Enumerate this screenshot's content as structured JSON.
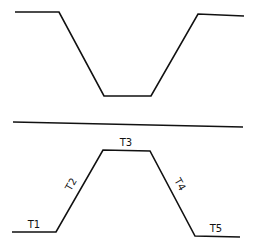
{
  "diagram": {
    "stroke_color": "#111111",
    "background": "#ffffff",
    "top_profile": {
      "description": "inverted trapezoid (valley)",
      "points": [
        [
          15,
          12
        ],
        [
          59,
          12
        ],
        [
          104,
          96
        ],
        [
          151,
          96
        ],
        [
          198,
          14
        ],
        [
          244,
          16
        ]
      ]
    },
    "divider": {
      "from": [
        13,
        122
      ],
      "to": [
        243,
        127
      ]
    },
    "bottom_profile": {
      "description": "trapezoid (plateau) with labeled segments",
      "points": [
        [
          12,
          232
        ],
        [
          56,
          232
        ],
        [
          103,
          150
        ],
        [
          150,
          151
        ],
        [
          195,
          236
        ],
        [
          240,
          237
        ]
      ]
    },
    "labels": [
      {
        "id": "T1",
        "text": "T1",
        "x": 34,
        "y": 228,
        "rotate": 0
      },
      {
        "id": "T2",
        "text": "T2",
        "x": 74,
        "y": 186,
        "rotate": -60
      },
      {
        "id": "T3",
        "text": "T3",
        "x": 126,
        "y": 146,
        "rotate": 0
      },
      {
        "id": "T4",
        "text": "T4",
        "x": 177,
        "y": 186,
        "rotate": 60
      },
      {
        "id": "T5",
        "text": "T5",
        "x": 216,
        "y": 232,
        "rotate": 0
      }
    ]
  }
}
